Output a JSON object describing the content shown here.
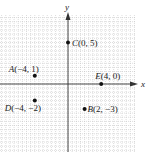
{
  "chart_data": {
    "type": "scatter",
    "title": "",
    "xlabel": "x",
    "ylabel": "y",
    "xlim": [
      -8,
      8
    ],
    "ylim": [
      -8,
      8.5
    ],
    "grid": true,
    "points": [
      {
        "name": "A",
        "x": -4,
        "y": 1,
        "label": "A(−4, 1)"
      },
      {
        "name": "C",
        "x": 0,
        "y": 5,
        "label": "C(0, 5)"
      },
      {
        "name": "E",
        "x": 4,
        "y": 0,
        "label": "E(4, 0)"
      },
      {
        "name": "D",
        "x": -4,
        "y": -2,
        "label": "D(−4, −2)"
      },
      {
        "name": "B",
        "x": 2,
        "y": -3,
        "label": "B(2, −3)"
      }
    ]
  },
  "axes": {
    "x_label": "x",
    "y_label": "y"
  },
  "colors": {
    "grid": "#bbbbbb",
    "axis": "#333333",
    "point": "#111111"
  }
}
